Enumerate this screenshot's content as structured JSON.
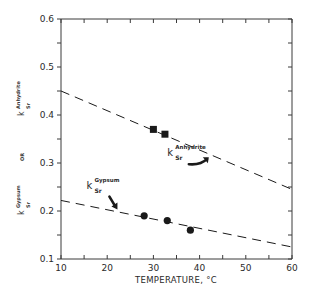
{
  "chart_data": {
    "type": "scatter",
    "title": "",
    "xlabel": "TEMPERATURE, °C",
    "ylabel": {
      "top": {
        "symbol": "k",
        "superscript": "Anhydrite",
        "subscript": "Sr"
      },
      "middle": "OR",
      "bottom": {
        "symbol": "k",
        "superscript": "Gypsum",
        "subscript": "Sr"
      }
    },
    "xlim": [
      10,
      60
    ],
    "ylim": [
      0.1,
      0.6
    ],
    "x_ticks": [
      10,
      20,
      30,
      40,
      50,
      60
    ],
    "x_tick_labels": [
      "10",
      "20",
      "30",
      "40",
      "50",
      "60"
    ],
    "y_ticks": [
      0.1,
      0.2,
      0.3,
      0.4,
      0.5,
      0.6
    ],
    "y_tick_labels": [
      "0.1",
      "0.2",
      "0.3",
      "0.4",
      "0.5",
      "0.6"
    ],
    "grid": false,
    "legend": null,
    "series": [
      {
        "name": "Anhydrite (measured)",
        "marker": "square",
        "points": [
          {
            "x": 30,
            "y": 0.37
          },
          {
            "x": 32.5,
            "y": 0.36
          }
        ]
      },
      {
        "name": "Anhydrite (trend)",
        "style": "dashed",
        "points": [
          {
            "x": 10,
            "y": 0.45
          },
          {
            "x": 60,
            "y": 0.245
          }
        ]
      },
      {
        "name": "Gypsum (measured)",
        "marker": "circle",
        "points": [
          {
            "x": 28,
            "y": 0.19
          },
          {
            "x": 33,
            "y": 0.18
          },
          {
            "x": 38,
            "y": 0.16
          }
        ]
      },
      {
        "name": "Gypsum (trend)",
        "style": "dashed",
        "points": [
          {
            "x": 10,
            "y": 0.222
          },
          {
            "x": 60,
            "y": 0.125
          }
        ]
      }
    ],
    "annotations": [
      {
        "symbol": "k",
        "superscript": "Anhydrite",
        "subscript": "Sr",
        "x": 33,
        "y": 0.315,
        "arrow_to": {
          "x": 42,
          "y": 0.31
        }
      },
      {
        "symbol": "k",
        "superscript": "Gypsum",
        "subscript": "Sr",
        "x": 15.5,
        "y": 0.245,
        "arrow_to": {
          "x": 22,
          "y": 0.205
        }
      }
    ]
  },
  "colors": {
    "ink": "#1a1a1a",
    "axis": "#3a3a3a",
    "background": "#ffffff"
  }
}
